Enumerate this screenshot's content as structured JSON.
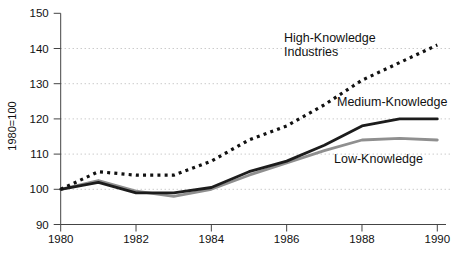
{
  "figure": {
    "background": "#ffffff",
    "text_color": "#111111",
    "grid_color": "#b3b3b3",
    "axis_color": "#444444",
    "y_axis_unit_label": "1980=100",
    "annotations": {
      "high_line1": "High-Knowledge",
      "high_line2": "Industries",
      "medium": "Medium-Knowledge",
      "low": "Low-Knowledge"
    }
  },
  "chart_data": {
    "type": "line",
    "title": "",
    "xlabel": "",
    "ylabel": "1980=100",
    "xlim": [
      1980,
      1990
    ],
    "ylim": [
      90,
      150
    ],
    "x": [
      1980,
      1981,
      1982,
      1983,
      1984,
      1985,
      1986,
      1987,
      1988,
      1989,
      1990
    ],
    "x_ticks": [
      1980,
      1982,
      1984,
      1986,
      1988,
      1990
    ],
    "x_tick_labels": [
      "1980",
      "1982",
      "1984",
      "1986",
      "1988",
      "1990"
    ],
    "y_ticks": [
      90,
      100,
      110,
      120,
      130,
      140,
      150
    ],
    "y_tick_labels": [
      "90",
      "100",
      "110",
      "120",
      "130",
      "140",
      "150"
    ],
    "gridlines": {
      "orientation": "horizontal",
      "style": "dotted",
      "at": [
        100,
        110,
        120,
        130,
        140
      ]
    },
    "legend_position": "inline-labels",
    "series": [
      {
        "name": "High-Knowledge Industries",
        "line_style": "dotted",
        "color": "#111111",
        "values": [
          100,
          105,
          104,
          104,
          108,
          114,
          118,
          124,
          131,
          136,
          141
        ]
      },
      {
        "name": "Medium-Knowledge",
        "line_style": "solid",
        "color": "#1c1c1c",
        "values": [
          100,
          102,
          99,
          99,
          100.5,
          105,
          108,
          112.5,
          118,
          120,
          120
        ]
      },
      {
        "name": "Low-Knowledge",
        "line_style": "solid",
        "color": "#8f8f8f",
        "values": [
          100,
          102.5,
          99.5,
          98,
          100,
          104,
          107.5,
          111,
          114,
          114.5,
          114
        ]
      }
    ]
  }
}
